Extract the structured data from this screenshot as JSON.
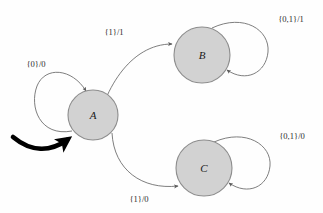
{
  "diagram": {
    "type": "finite-state-machine",
    "title": "",
    "background_color": "#fefefe",
    "state_fill_color": "#d2d2d2",
    "state_stroke_color": "#8d8d8d",
    "edge_color": "#6f6f6f",
    "start_arrow_color": "#000000",
    "states": [
      {
        "id": "A",
        "label": "A",
        "cx": 93,
        "cy": 115,
        "r": 25,
        "initial": true
      },
      {
        "id": "B",
        "label": "B",
        "cx": 202,
        "cy": 55,
        "r": 28,
        "initial": false
      },
      {
        "id": "C",
        "label": "C",
        "cx": 204,
        "cy": 168,
        "r": 28,
        "initial": false
      }
    ],
    "transitions": [
      {
        "id": "a-self",
        "from": "A",
        "to": "A",
        "inputs": "{0}",
        "output": "0",
        "label": "{0}/0",
        "label_x": 36,
        "label_y": 65,
        "kind": "self-loop",
        "loop_side": "left"
      },
      {
        "id": "a-to-b",
        "from": "A",
        "to": "B",
        "inputs": "{1}",
        "output": "1",
        "label": "{1}/1",
        "label_x": 114,
        "label_y": 33,
        "kind": "curve"
      },
      {
        "id": "a-to-c",
        "from": "A",
        "to": "C",
        "inputs": "{1}",
        "output": "0",
        "label": "{1}/0",
        "label_x": 139,
        "label_y": 200,
        "kind": "curve"
      },
      {
        "id": "b-self",
        "from": "B",
        "to": "B",
        "inputs": "{0,1}",
        "output": "1",
        "label": "{0,1}/1",
        "label_x": 291,
        "label_y": 20,
        "kind": "self-loop",
        "loop_side": "right"
      },
      {
        "id": "c-self",
        "from": "C",
        "to": "C",
        "inputs": "{0,1}",
        "output": "0",
        "label": "{0,1}/0",
        "label_x": 292,
        "label_y": 137,
        "kind": "self-loop",
        "loop_side": "right"
      }
    ],
    "start_marker": {
      "name": "initial-state-arrow",
      "target": "A",
      "style": "thick-curved-arrow"
    }
  }
}
